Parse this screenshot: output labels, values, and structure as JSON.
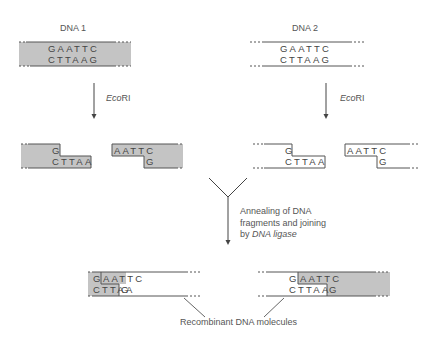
{
  "colors": {
    "shade": "#c4c4c4",
    "line": "#555555",
    "text": "#444444",
    "background": "#ffffff"
  },
  "dna1": {
    "title": "DNA 1",
    "top_strand": "GAATTC",
    "bottom_strand": "CTTAAG",
    "shaded": true
  },
  "dna2": {
    "title": "DNA 2",
    "top_strand": "GAATTC",
    "bottom_strand": "CTTAAG",
    "shaded": false
  },
  "enzyme": {
    "name_italic": "Eco",
    "name_plain": "RI"
  },
  "fragments": {
    "dna1_left": {
      "top": "G",
      "bottom": "CTTAA"
    },
    "dna1_right": {
      "top": "AATTC",
      "bottom": "G"
    },
    "dna2_left": {
      "top": "G",
      "bottom": "CTTAA"
    },
    "dna2_right": {
      "top": "AATTC",
      "bottom": "G"
    }
  },
  "annealing": {
    "line1": "Annealing of DNA",
    "line2": "fragments and joining",
    "line3_prefix": "by ",
    "line3_italic": "DNA ligase"
  },
  "recombinant": {
    "left": {
      "top_first": "G",
      "top_rest": "AATTC",
      "bottom_first": "CTTAA",
      "bottom_rest": "G"
    },
    "right": {
      "top_first": "G",
      "top_rest": "AATTC",
      "bottom_first": "CTTAA",
      "bottom_rest": "G"
    },
    "caption": "Recombinant DNA molecules"
  }
}
